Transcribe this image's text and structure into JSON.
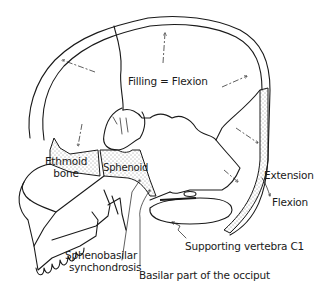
{
  "diagram": {
    "labels": {
      "filling": "Filling = Flexion",
      "ethmoid_line1": "Ethmoid",
      "ethmoid_line2": "bone",
      "sphenoid": "Sphenoid",
      "extension": "Extension",
      "flexion": "Flexion",
      "supporting_vertebra": "Supporting vertebra C1",
      "sphenobasilar_line1": "Sphenobasilar",
      "sphenobasilar_line2": "synchondrosis",
      "basilar_part": "Basilar part of the occiput"
    },
    "colors": {
      "line": "#1a1a1a",
      "background": "#ffffff"
    }
  }
}
